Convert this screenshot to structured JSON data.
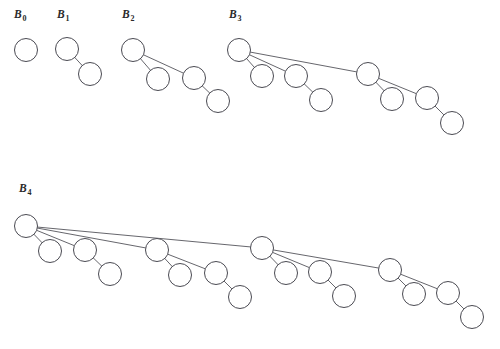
{
  "figure": {
    "title_text": "",
    "background_color": "#ffffff",
    "stroke_color": "#4a4a52",
    "node_fill_color": "#ffffff",
    "label_color": "#2b2b2b",
    "node_radius": 11.5,
    "canvas": {
      "width": 500,
      "height": 349
    }
  },
  "chart_data": {
    "type": "diagram",
    "diagram_kind": "binomial-trees",
    "title": "",
    "xlabel": "",
    "ylabel": "",
    "trees": [
      {
        "id": "B0",
        "label_base": "B",
        "label_subscript": "0",
        "label_x": 14,
        "label_y": 8,
        "order": 0,
        "node_count": 1,
        "nodes": [
          {
            "id": "b0-root",
            "x": 26,
            "y": 50,
            "depth": 0
          }
        ],
        "edges": []
      },
      {
        "id": "B1",
        "label_base": "B",
        "label_subscript": "1",
        "label_x": 57,
        "label_y": 8,
        "order": 1,
        "node_count": 2,
        "nodes": [
          {
            "id": "b1-root",
            "x": 67,
            "y": 49,
            "depth": 0
          },
          {
            "id": "b1-c1",
            "x": 90,
            "y": 74,
            "depth": 1
          }
        ],
        "edges": [
          {
            "from": "b1-root",
            "to": "b1-c1"
          }
        ]
      },
      {
        "id": "B2",
        "label_base": "B",
        "label_subscript": "2",
        "label_x": 122,
        "label_y": 8,
        "order": 2,
        "node_count": 4,
        "nodes": [
          {
            "id": "b2-root",
            "x": 133,
            "y": 50,
            "depth": 0
          },
          {
            "id": "b2-c1",
            "x": 158,
            "y": 79,
            "depth": 1
          },
          {
            "id": "b2-c2",
            "x": 194,
            "y": 78,
            "depth": 1
          },
          {
            "id": "b2-c2-c1",
            "x": 218,
            "y": 101,
            "depth": 2
          }
        ],
        "edges": [
          {
            "from": "b2-root",
            "to": "b2-c1"
          },
          {
            "from": "b2-root",
            "to": "b2-c2"
          },
          {
            "from": "b2-c2",
            "to": "b2-c2-c1"
          }
        ]
      },
      {
        "id": "B3",
        "label_base": "B",
        "label_subscript": "3",
        "label_x": 229,
        "label_y": 8,
        "order": 3,
        "node_count": 8,
        "nodes": [
          {
            "id": "b3-root",
            "x": 239,
            "y": 50,
            "depth": 0
          },
          {
            "id": "b3-c1",
            "x": 262,
            "y": 76,
            "depth": 1
          },
          {
            "id": "b3-c2",
            "x": 296,
            "y": 76,
            "depth": 1
          },
          {
            "id": "b3-c2-c1",
            "x": 321,
            "y": 100,
            "depth": 2
          },
          {
            "id": "b3-c3",
            "x": 368,
            "y": 74,
            "depth": 1
          },
          {
            "id": "b3-c3-c1",
            "x": 392,
            "y": 99,
            "depth": 2
          },
          {
            "id": "b3-c3-c2",
            "x": 427,
            "y": 98,
            "depth": 2
          },
          {
            "id": "b3-c3-c2-c1",
            "x": 452,
            "y": 123,
            "depth": 3
          }
        ],
        "edges": [
          {
            "from": "b3-root",
            "to": "b3-c1"
          },
          {
            "from": "b3-root",
            "to": "b3-c2"
          },
          {
            "from": "b3-root",
            "to": "b3-c3"
          },
          {
            "from": "b3-c2",
            "to": "b3-c2-c1"
          },
          {
            "from": "b3-c3",
            "to": "b3-c3-c1"
          },
          {
            "from": "b3-c3",
            "to": "b3-c3-c2"
          },
          {
            "from": "b3-c3-c2",
            "to": "b3-c3-c2-c1"
          }
        ]
      },
      {
        "id": "B4",
        "label_base": "B",
        "label_subscript": "4",
        "label_x": 19,
        "label_y": 182,
        "order": 4,
        "node_count": 16,
        "nodes": [
          {
            "id": "b4-root",
            "x": 26,
            "y": 226,
            "depth": 0
          },
          {
            "id": "b4-c1",
            "x": 50,
            "y": 251,
            "depth": 1
          },
          {
            "id": "b4-c2",
            "x": 85,
            "y": 250,
            "depth": 1
          },
          {
            "id": "b4-c2-c1",
            "x": 110,
            "y": 274,
            "depth": 2
          },
          {
            "id": "b4-c3",
            "x": 157,
            "y": 250,
            "depth": 1
          },
          {
            "id": "b4-c3-c1",
            "x": 180,
            "y": 275,
            "depth": 2
          },
          {
            "id": "b4-c3-c2",
            "x": 216,
            "y": 273,
            "depth": 2
          },
          {
            "id": "b4-c3-c2-c1",
            "x": 240,
            "y": 297,
            "depth": 3
          },
          {
            "id": "b4-c4",
            "x": 262,
            "y": 248,
            "depth": 1
          },
          {
            "id": "b4-c4-c1",
            "x": 286,
            "y": 273,
            "depth": 2
          },
          {
            "id": "b4-c4-c2",
            "x": 320,
            "y": 272,
            "depth": 2
          },
          {
            "id": "b4-c4-c2-c1",
            "x": 344,
            "y": 296,
            "depth": 3
          },
          {
            "id": "b4-c4-c3",
            "x": 390,
            "y": 270,
            "depth": 2
          },
          {
            "id": "b4-c4-c3-c1",
            "x": 414,
            "y": 294,
            "depth": 3
          },
          {
            "id": "b4-c4-c3-c2",
            "x": 448,
            "y": 293,
            "depth": 3
          },
          {
            "id": "b4-c4-c3-c2-c1",
            "x": 472,
            "y": 317,
            "depth": 4
          }
        ],
        "edges": [
          {
            "from": "b4-root",
            "to": "b4-c1"
          },
          {
            "from": "b4-root",
            "to": "b4-c2"
          },
          {
            "from": "b4-root",
            "to": "b4-c3"
          },
          {
            "from": "b4-root",
            "to": "b4-c4"
          },
          {
            "from": "b4-c2",
            "to": "b4-c2-c1"
          },
          {
            "from": "b4-c3",
            "to": "b4-c3-c1"
          },
          {
            "from": "b4-c3",
            "to": "b4-c3-c2"
          },
          {
            "from": "b4-c3-c2",
            "to": "b4-c3-c2-c1"
          },
          {
            "from": "b4-c4",
            "to": "b4-c4-c1"
          },
          {
            "from": "b4-c4",
            "to": "b4-c4-c2"
          },
          {
            "from": "b4-c4-c2",
            "to": "b4-c4-c2-c1"
          },
          {
            "from": "b4-c4",
            "to": "b4-c4-c3"
          },
          {
            "from": "b4-c4-c3",
            "to": "b4-c4-c3-c1"
          },
          {
            "from": "b4-c4-c3",
            "to": "b4-c4-c3-c2"
          },
          {
            "from": "b4-c4-c3-c2",
            "to": "b4-c4-c3-c2-c1"
          }
        ]
      }
    ]
  }
}
